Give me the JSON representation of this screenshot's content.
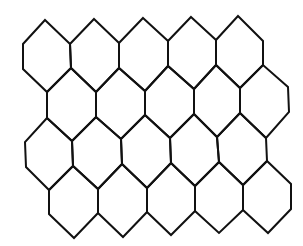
{
  "diagram": {
    "type": "hexagonal-grid",
    "rows": 4,
    "columns": 5,
    "stroke_color": "#111111",
    "background_color": "#ffffff",
    "cells": [
      {
        "row": 0,
        "col": 0,
        "points": [
          [
            45,
            20
          ],
          [
            70,
            44
          ],
          [
            71,
            68
          ],
          [
            47,
            92
          ],
          [
            23,
            69
          ],
          [
            23,
            44
          ]
        ]
      },
      {
        "row": 0,
        "col": 1,
        "points": [
          [
            94,
            19
          ],
          [
            119,
            43
          ],
          [
            119,
            68
          ],
          [
            96,
            92
          ],
          [
            71,
            68
          ],
          [
            70,
            44
          ]
        ]
      },
      {
        "row": 0,
        "col": 2,
        "points": [
          [
            143,
            18
          ],
          [
            168,
            41
          ],
          [
            168,
            66
          ],
          [
            145,
            91
          ],
          [
            119,
            68
          ],
          [
            119,
            43
          ]
        ]
      },
      {
        "row": 0,
        "col": 3,
        "points": [
          [
            191,
            17
          ],
          [
            216,
            40
          ],
          [
            216,
            65
          ],
          [
            194,
            89
          ],
          [
            168,
            66
          ],
          [
            168,
            41
          ]
        ]
      },
      {
        "row": 0,
        "col": 4,
        "points": [
          [
            238,
            16
          ],
          [
            263,
            41
          ],
          [
            263,
            65
          ],
          [
            240,
            88
          ],
          [
            216,
            65
          ],
          [
            216,
            40
          ]
        ]
      },
      {
        "row": 1,
        "col": 0,
        "points": [
          [
            47,
            92
          ],
          [
            71,
            68
          ],
          [
            96,
            92
          ],
          [
            96,
            117
          ],
          [
            72,
            141
          ],
          [
            47,
            118
          ]
        ]
      },
      {
        "row": 1,
        "col": 1,
        "points": [
          [
            96,
            92
          ],
          [
            119,
            68
          ],
          [
            145,
            91
          ],
          [
            145,
            115
          ],
          [
            121,
            139
          ],
          [
            96,
            117
          ]
        ]
      },
      {
        "row": 1,
        "col": 2,
        "points": [
          [
            145,
            91
          ],
          [
            168,
            66
          ],
          [
            194,
            89
          ],
          [
            194,
            114
          ],
          [
            170,
            138
          ],
          [
            145,
            115
          ]
        ]
      },
      {
        "row": 1,
        "col": 3,
        "points": [
          [
            194,
            89
          ],
          [
            216,
            65
          ],
          [
            240,
            88
          ],
          [
            240,
            113
          ],
          [
            217,
            137
          ],
          [
            194,
            114
          ]
        ]
      },
      {
        "row": 1,
        "col": 4,
        "points": [
          [
            240,
            88
          ],
          [
            263,
            65
          ],
          [
            288,
            87
          ],
          [
            289,
            112
          ],
          [
            266,
            138
          ],
          [
            240,
            113
          ]
        ]
      },
      {
        "row": 2,
        "col": 0,
        "points": [
          [
            47,
            118
          ],
          [
            72,
            141
          ],
          [
            73,
            166
          ],
          [
            49,
            190
          ],
          [
            26,
            167
          ],
          [
            25,
            142
          ]
        ]
      },
      {
        "row": 2,
        "col": 1,
        "points": [
          [
            96,
            117
          ],
          [
            121,
            139
          ],
          [
            122,
            164
          ],
          [
            98,
            189
          ],
          [
            73,
            166
          ],
          [
            72,
            141
          ]
        ]
      },
      {
        "row": 2,
        "col": 2,
        "points": [
          [
            145,
            115
          ],
          [
            170,
            138
          ],
          [
            171,
            163
          ],
          [
            147,
            188
          ],
          [
            122,
            164
          ],
          [
            121,
            139
          ]
        ]
      },
      {
        "row": 2,
        "col": 3,
        "points": [
          [
            194,
            114
          ],
          [
            217,
            137
          ],
          [
            219,
            162
          ],
          [
            195,
            186
          ],
          [
            171,
            163
          ],
          [
            170,
            138
          ]
        ]
      },
      {
        "row": 2,
        "col": 4,
        "points": [
          [
            240,
            113
          ],
          [
            266,
            138
          ],
          [
            267,
            161
          ],
          [
            243,
            185
          ],
          [
            219,
            162
          ],
          [
            217,
            137
          ]
        ]
      },
      {
        "row": 3,
        "col": 0,
        "points": [
          [
            49,
            190
          ],
          [
            73,
            166
          ],
          [
            98,
            189
          ],
          [
            98,
            213
          ],
          [
            74,
            238
          ],
          [
            49,
            214
          ]
        ]
      },
      {
        "row": 3,
        "col": 1,
        "points": [
          [
            98,
            189
          ],
          [
            122,
            164
          ],
          [
            147,
            188
          ],
          [
            147,
            212
          ],
          [
            123,
            237
          ],
          [
            98,
            213
          ]
        ]
      },
      {
        "row": 3,
        "col": 2,
        "points": [
          [
            147,
            188
          ],
          [
            171,
            163
          ],
          [
            195,
            186
          ],
          [
            195,
            211
          ],
          [
            171,
            235
          ],
          [
            147,
            212
          ]
        ]
      },
      {
        "row": 3,
        "col": 3,
        "points": [
          [
            195,
            186
          ],
          [
            219,
            162
          ],
          [
            243,
            185
          ],
          [
            243,
            210
          ],
          [
            219,
            233
          ],
          [
            195,
            211
          ]
        ]
      },
      {
        "row": 3,
        "col": 4,
        "points": [
          [
            243,
            185
          ],
          [
            267,
            161
          ],
          [
            291,
            184
          ],
          [
            291,
            209
          ],
          [
            268,
            233
          ],
          [
            243,
            210
          ]
        ]
      }
    ]
  }
}
